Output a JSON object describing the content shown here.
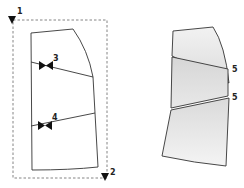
{
  "diagram": {
    "labels": {
      "point1": "1",
      "point2": "2",
      "slash3": "3",
      "slash4": "4",
      "spread_top": "5",
      "spread_bottom": "5"
    },
    "colors": {
      "line": "#333333",
      "dashed": "#777777",
      "fill_top": "#e6e6e6",
      "fill_mid": "#dcdcdc",
      "fill_bottom": "#d8d8d8"
    }
  }
}
